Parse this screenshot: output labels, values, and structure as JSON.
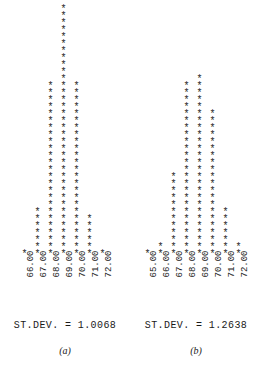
{
  "figure": {
    "glyph": "*",
    "panels": [
      {
        "id": "a",
        "caption": "(a)",
        "stdev_text": "ST.DEV. =  1.0068",
        "stdev_label": "ST.DEV.",
        "stdev_value": "1.0068",
        "offset_left": 18,
        "ticks": [
          "66.00",
          "67.00",
          "68.00",
          "69.00",
          "70.00",
          "71.00",
          "72.00"
        ],
        "counts": [
          1,
          7,
          25,
          36,
          25,
          6,
          1
        ]
      },
      {
        "id": "b",
        "caption": "(b)",
        "stdev_text": "ST.DEV. =  1.2638",
        "stdev_label": "ST.DEV.",
        "stdev_value": "1.2638",
        "offset_left": 10,
        "ticks": [
          "65.00",
          "66.00",
          "67.00",
          "68.00",
          "69.00",
          "70.00",
          "71.00",
          "72.00"
        ],
        "counts": [
          1,
          2,
          12,
          25,
          26,
          21,
          7,
          2
        ]
      }
    ]
  },
  "chart_data": {
    "type": "bar",
    "title": "",
    "xlabel": "",
    "ylabel": "",
    "note": "Two dot/asterisk-plot histograms of a measured variable; each asterisk represents one observation.",
    "charts": [
      {
        "label": "(a)",
        "categories": [
          "66.00",
          "67.00",
          "68.00",
          "69.00",
          "70.00",
          "71.00",
          "72.00"
        ],
        "values": [
          1,
          7,
          25,
          36,
          25,
          6,
          1
        ],
        "annotation": "ST.DEV. =  1.0068",
        "stdev": 1.0068,
        "ylim": [
          0,
          36
        ],
        "grid": false,
        "legend": "none"
      },
      {
        "label": "(b)",
        "categories": [
          "65.00",
          "66.00",
          "67.00",
          "68.00",
          "69.00",
          "70.00",
          "71.00",
          "72.00"
        ],
        "values": [
          1,
          2,
          12,
          25,
          26,
          21,
          7,
          2
        ],
        "annotation": "ST.DEV. =  1.2638",
        "stdev": 1.2638,
        "ylim": [
          0,
          26
        ],
        "grid": false,
        "legend": "none"
      }
    ]
  }
}
